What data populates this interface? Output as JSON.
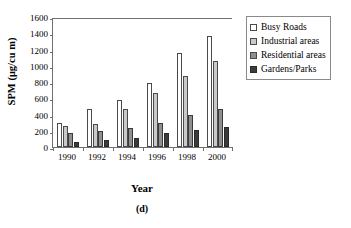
{
  "chart_data": {
    "type": "bar",
    "title": "",
    "caption": "(d)",
    "xlabel": "Year",
    "ylabel": "SPM (μg/cu m)",
    "categories": [
      "1990",
      "1992",
      "1994",
      "1996",
      "1998",
      "2000"
    ],
    "ylim": [
      0,
      1600
    ],
    "ytick_labels": [
      "0",
      "200",
      "400",
      "600",
      "800",
      "1000",
      "1200",
      "1400",
      "1600"
    ],
    "ytick_values": [
      0,
      200,
      400,
      600,
      800,
      1000,
      1200,
      1400,
      1600
    ],
    "grid": false,
    "legend_position": "top-right",
    "series": [
      {
        "name": "Busy Roads",
        "color": "#ffffff",
        "values": [
          300,
          470,
          590,
          800,
          1170,
          1390
        ]
      },
      {
        "name": "Industrial areas",
        "color": "#c9c9c9",
        "values": [
          260,
          290,
          470,
          680,
          890,
          1070
        ]
      },
      {
        "name": "Residential areas",
        "color": "#8f8f8f",
        "values": [
          170,
          205,
          235,
          300,
          400,
          470
        ]
      },
      {
        "name": "Gardens/Parks",
        "color": "#3b3b3b",
        "values": [
          65,
          90,
          110,
          170,
          210,
          255
        ]
      }
    ]
  }
}
